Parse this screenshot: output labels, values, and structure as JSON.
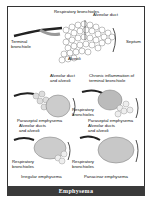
{
  "caption": "Emphysema",
  "panels": {
    "normal": {
      "labels": {
        "respiratory_bronchioles": "Respiratory bronchioles",
        "alveolar_duct": "Alveolar duct",
        "terminal_bronchiole": "Terminal bronchiole",
        "septum": "Septum",
        "alveoli": "Alveoli"
      }
    },
    "paraseptal": {
      "labels": {
        "alveolar_duct_alveoli": "Alveolar duct and alveoli",
        "title": "Paraseptal emphysema"
      }
    },
    "centriacinar": {
      "labels": {
        "chronic_inflammation": "Chronic inflammation of terminal bronchiole",
        "respiratory_bronchioles": "Respiratory bronchioles",
        "title": "Paraseptal emphysema"
      }
    },
    "irregular": {
      "labels": {
        "alveolar_ducts_alveoli": "Alveolar ducts and alveoli",
        "respiratory_bronchioles": "Respiratory bronchioles",
        "title": "Irregular emphysema"
      }
    },
    "panacinar": {
      "labels": {
        "alveolar_ducts_alveoli": "Alveolar ducts and alveoli",
        "respiratory_bronchioles": "Respiratory bronchioles",
        "title": "Panacinar emphysema"
      }
    }
  }
}
